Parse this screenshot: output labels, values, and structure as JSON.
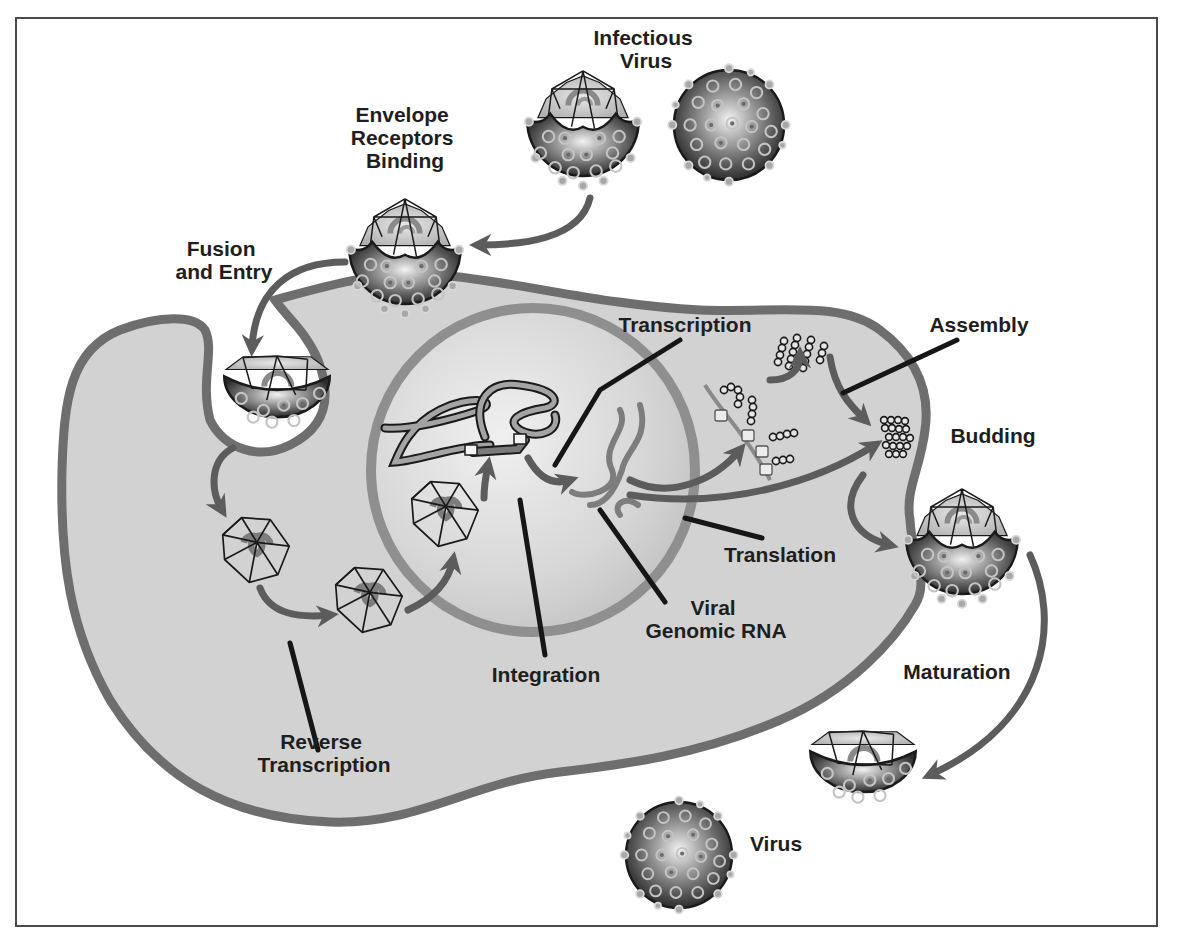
{
  "figure": {
    "colors": {
      "background": "#ffffff",
      "frame": "#4a4a4a",
      "cytoplasm": "#d2d2d2",
      "membrane": "#6e6e6e",
      "nucleus_fill": "#dcdcdc",
      "nuclear_envelope": "#8f8f8f",
      "arrow": "#5c5c5c",
      "leader_line": "#161616",
      "virion_envelope_dark": "#3a3a3a",
      "label_text": "#1e1e1e"
    }
  },
  "labels": {
    "infectious_virus": [
      "Infectious",
      "Virus"
    ],
    "envelope_receptors_binding": [
      "Envelope",
      "Receptors",
      "Binding"
    ],
    "fusion_and_entry": [
      "Fusion",
      "and Entry"
    ],
    "transcription": [
      "Transcription"
    ],
    "assembly": [
      "Assembly"
    ],
    "budding": [
      "Budding"
    ],
    "translation": [
      "Translation"
    ],
    "viral_genomic_rna": [
      "Viral",
      "Genomic RNA"
    ],
    "integration": [
      "Integration"
    ],
    "reverse_transcription": [
      "Reverse",
      "Transcription"
    ],
    "maturation": [
      "Maturation"
    ],
    "virus": [
      "Virus"
    ]
  },
  "stages": [
    "Infectious Virus",
    "Envelope Receptors Binding",
    "Fusion and Entry",
    "Reverse Transcription",
    "Integration",
    "Transcription",
    "Viral Genomic RNA",
    "Translation",
    "Assembly",
    "Budding",
    "Maturation",
    "Virus"
  ]
}
